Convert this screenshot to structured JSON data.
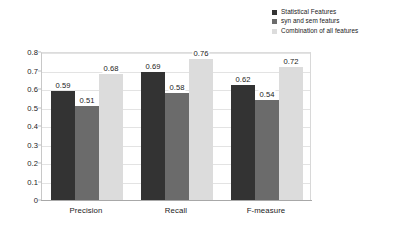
{
  "chart_data": {
    "type": "bar",
    "title": "",
    "xlabel": "",
    "ylabel": "",
    "ylim": [
      0,
      0.8
    ],
    "ytick_labels": [
      "0.8",
      "0.7",
      "0.6",
      "0.5",
      "0.4",
      "0.3",
      "0.2",
      "0.1",
      "0"
    ],
    "ytick_values": [
      0.8,
      0.7,
      0.6,
      0.5,
      0.4,
      0.3,
      0.2,
      0.1,
      0
    ],
    "grid": true,
    "legend_position": "top-right",
    "categories": [
      "Precision",
      "Recall",
      "F-measure"
    ],
    "series": [
      {
        "name": "Statistical Features",
        "color": "#333333",
        "values": [
          0.59,
          0.69,
          0.62
        ],
        "labels": [
          "0.59",
          "0.69",
          "0.62"
        ]
      },
      {
        "name": "syn and sem featurs",
        "color": "#6b6b6b",
        "values": [
          0.51,
          0.58,
          0.54
        ],
        "labels": [
          "0.51",
          "0.58",
          "0.54"
        ]
      },
      {
        "name": "Combination of all features",
        "color": "#dcdcdc",
        "values": [
          0.68,
          0.76,
          0.72
        ],
        "labels": [
          "0.68",
          "0.76",
          "0.72"
        ]
      }
    ]
  },
  "colors": {
    "series_1": "#333333",
    "series_2": "#6b6b6b",
    "series_3": "#dcdcdc",
    "gridline": "#e3e3e3",
    "axis": "#a8a8a8",
    "text": "#1a1a1a",
    "background": "#ffffff"
  }
}
